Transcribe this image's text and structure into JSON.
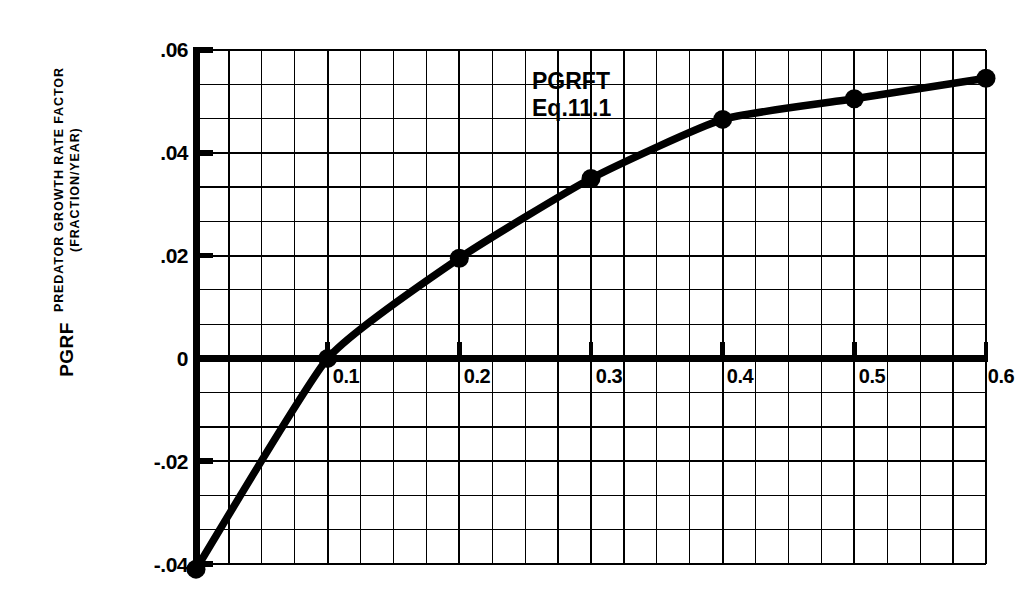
{
  "figure": {
    "background": "#ffffff",
    "ink": "#000000"
  },
  "axis_title": {
    "main": "PGRF",
    "line1": "PREDATOR GROWTH RATE FACTOR",
    "line2": "(FRACTION/YEAR)"
  },
  "annotation": {
    "line1": "PGRFT",
    "line2": "Eq.11.1"
  },
  "chart_data": {
    "type": "line",
    "title": "",
    "subtitle": "",
    "xlabel": "",
    "ylabel": "PGRF  PREDATOR GROWTH RATE FACTOR (FRACTION/YEAR)",
    "xlim": [
      0,
      0.6
    ],
    "ylim": [
      -0.04,
      0.06
    ],
    "grid": true,
    "legend": null,
    "x_major_ticks": [
      0.1,
      0.2,
      0.3,
      0.4,
      0.5,
      0.6
    ],
    "x_tick_labels": [
      "0.1",
      "0.2",
      "0.3",
      "0.4",
      "0.5",
      "0.6"
    ],
    "x_minor_step": 0.025,
    "y_major_ticks": [
      -0.04,
      -0.02,
      0,
      0.02,
      0.04,
      0.06
    ],
    "y_tick_labels": [
      "-.04",
      "-.02",
      "0",
      ".02",
      ".04",
      ".06"
    ],
    "y_minor_step": 0.006667,
    "zero_line": 0,
    "series": [
      {
        "name": "PGRFT Eq.11.1",
        "marker": "filled-circle",
        "x": [
          0,
          0.1,
          0.2,
          0.3,
          0.4,
          0.5,
          0.6
        ],
        "values": [
          -0.041,
          0.0,
          0.0195,
          0.035,
          0.0465,
          0.0505,
          0.0545
        ],
        "markers_shown_at": [
          0,
          0.1,
          0.2,
          0.3,
          0.4,
          0.5,
          0.6
        ]
      }
    ],
    "annotations": [
      {
        "text": "PGRFT",
        "x": 0.34,
        "y": 0.0535
      },
      {
        "text": "Eq.11.1",
        "x": 0.34,
        "y": 0.0465
      }
    ]
  },
  "geometry": {
    "plot_left": 196,
    "plot_right": 986,
    "plot_top": 50,
    "plot_bottom": 564
  }
}
